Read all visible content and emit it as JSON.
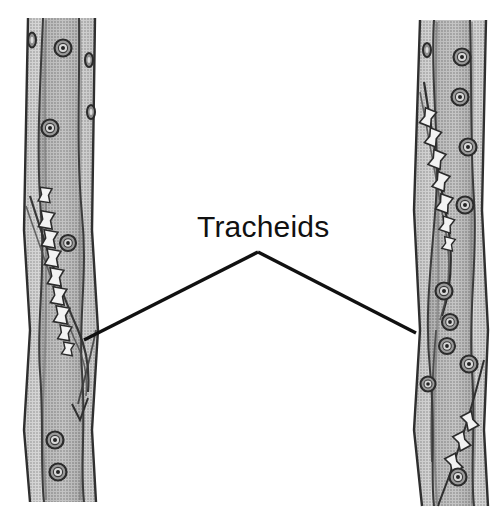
{
  "figure": {
    "title": "Tracheids",
    "background_color": "#ffffff",
    "width": 499,
    "height": 520,
    "style": "grayscale halftone botanical line illustration"
  },
  "label": {
    "text": "Tracheids",
    "color": "#111111",
    "font_size_px": 30,
    "x": 197,
    "y": 237
  },
  "leader_lines": {
    "color": "#111111",
    "stroke_width": 3.4,
    "apex": {
      "x": 258,
      "y": 252
    },
    "left_end": {
      "x": 84,
      "y": 340
    },
    "right_end": {
      "x": 416,
      "y": 333
    }
  },
  "specimens": [
    {
      "name": "left-tracheid",
      "side": "left",
      "top_y": 18,
      "bottom_y": 502,
      "left_x": 24,
      "right_x": 98,
      "wall_color": "#8d8d8d",
      "lumen_color": "#a6a6a6",
      "outline_color": "#3a3a3a",
      "bordered_pits": [
        {
          "cx": 63,
          "cy": 48,
          "r": 8.5
        },
        {
          "cx": 50,
          "cy": 128,
          "r": 8.5
        },
        {
          "cx": 68,
          "cy": 243,
          "r": 8.0
        },
        {
          "cx": 87,
          "cy": 60,
          "r": 7.0
        },
        {
          "cx": 89,
          "cy": 112,
          "r": 7.0
        },
        {
          "cx": 55,
          "cy": 440,
          "r": 8.5
        },
        {
          "cx": 58,
          "cy": 472,
          "r": 8.5
        }
      ],
      "scalariform_bars": {
        "count": 9,
        "top_y": 212,
        "bottom_y": 352,
        "description": "chain of dumbbell-shaped wall thickenings along the overlapping tapered cell ends"
      }
    },
    {
      "name": "right-tracheid",
      "side": "right",
      "top_y": 20,
      "bottom_y": 506,
      "left_x": 414,
      "right_x": 488,
      "wall_color": "#8d8d8d",
      "lumen_color": "#a6a6a6",
      "outline_color": "#3a3a3a",
      "bordered_pits": [
        {
          "cx": 427,
          "cy": 50,
          "r": 7.0
        },
        {
          "cx": 462,
          "cy": 57,
          "r": 8.5
        },
        {
          "cx": 460,
          "cy": 97,
          "r": 8.5
        },
        {
          "cx": 468,
          "cy": 147,
          "r": 8.5
        },
        {
          "cx": 465,
          "cy": 205,
          "r": 8.5
        },
        {
          "cx": 444,
          "cy": 291,
          "r": 8.5
        },
        {
          "cx": 450,
          "cy": 322,
          "r": 8.0
        },
        {
          "cx": 447,
          "cy": 346,
          "r": 8.0
        },
        {
          "cx": 469,
          "cy": 364,
          "r": 8.5
        },
        {
          "cx": 428,
          "cy": 384,
          "r": 8.0
        },
        {
          "cx": 458,
          "cy": 477,
          "r": 8.5
        }
      ],
      "scalariform_bars": {
        "count": 8,
        "top_y": 108,
        "bottom_y": 255,
        "description": "slanted chain of dumbbell-shaped wall thickenings along the tapered overlap"
      }
    }
  ]
}
